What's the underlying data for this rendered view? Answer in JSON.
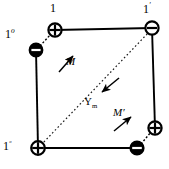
{
  "figure": {
    "name": "magnetic-dipole-square-lattice-diagram",
    "background_color": "#ffffff",
    "stroke_color": "#000000",
    "fill_dark": "#000000",
    "fill_light": "#ffffff"
  },
  "labels": {
    "top": "1",
    "top_left_base": "1",
    "top_left_sup": "o",
    "top_right_base": "1",
    "top_right_sup": "′",
    "bottom_left_base": "1",
    "bottom_left_sup": "ᵒ",
    "moment_m": "M",
    "moment_m_prime": "M′",
    "gamma_base": "Υ",
    "gamma_sub": "m"
  },
  "nodes": [
    {
      "name": "corner-top-left-plus",
      "x": 55,
      "y": 30,
      "symbol": "+",
      "style": "light-circle-black-glyph"
    },
    {
      "name": "dipole-top-left-minus",
      "x": 36,
      "y": 50,
      "symbol": "−",
      "style": "dark-circle-white-glyph"
    },
    {
      "name": "corner-top-right-minus",
      "x": 152,
      "y": 28,
      "symbol": "−",
      "style": "light-circle-black-glyph"
    },
    {
      "name": "corner-bottom-left-plus",
      "x": 38,
      "y": 148,
      "symbol": "+",
      "style": "light-circle-black-glyph"
    },
    {
      "name": "dipole-bottom-right-minus",
      "x": 137,
      "y": 148,
      "symbol": "−",
      "style": "dark-circle-white-glyph"
    },
    {
      "name": "dipole-bottom-right-plus",
      "x": 155,
      "y": 128,
      "symbol": "+",
      "style": "light-circle-black-glyph"
    }
  ],
  "edges": [
    {
      "name": "edge-top",
      "x1": 55,
      "y1": 30,
      "x2": 152,
      "y2": 28,
      "style": "solid"
    },
    {
      "name": "edge-left",
      "x1": 36,
      "y1": 50,
      "x2": 38,
      "y2": 148,
      "style": "solid"
    },
    {
      "name": "edge-right",
      "x1": 152,
      "y1": 28,
      "x2": 155,
      "y2": 128,
      "style": "solid"
    },
    {
      "name": "edge-bottom",
      "x1": 38,
      "y1": 148,
      "x2": 137,
      "y2": 148,
      "style": "solid"
    },
    {
      "name": "diagonal",
      "x1": 152,
      "y1": 28,
      "x2": 38,
      "y2": 148,
      "style": "dashed"
    },
    {
      "name": "dipole-link-top-left",
      "x1": 36,
      "y1": 50,
      "x2": 55,
      "y2": 30,
      "style": "dashed"
    },
    {
      "name": "dipole-link-bottom-right",
      "x1": 137,
      "y1": 148,
      "x2": 155,
      "y2": 128,
      "style": "dashed"
    }
  ],
  "arrows": [
    {
      "name": "arrow-m",
      "x1": 59,
      "y1": 72,
      "x2": 74,
      "y2": 55,
      "label": "M"
    },
    {
      "name": "arrow-m-prime",
      "x1": 114,
      "y1": 131,
      "x2": 132,
      "y2": 116,
      "label": "M′"
    },
    {
      "name": "arrow-gamma-m",
      "x1": 118,
      "y1": 79,
      "x2": 100,
      "y2": 93,
      "label": "Υm"
    }
  ]
}
